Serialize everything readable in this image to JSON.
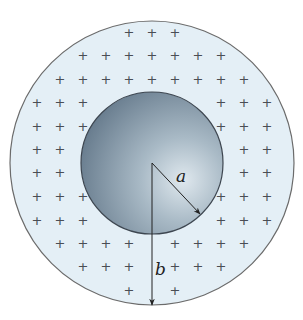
{
  "diagram": {
    "outer_circle": {
      "cx": 152,
      "cy": 163,
      "r": 142,
      "fill": "#e4eff6",
      "stroke": "#6b6b6b"
    },
    "inner_circle": {
      "cx": 152,
      "cy": 163,
      "r": 71,
      "fill_light": "#d9e3ea",
      "fill_dark": "#5f7587",
      "stroke": "#3d4650"
    },
    "charge_symbol": "+",
    "charges": [
      [
        129,
        32
      ],
      [
        152,
        32
      ],
      [
        175,
        32
      ],
      [
        83,
        55
      ],
      [
        106,
        55
      ],
      [
        129,
        55
      ],
      [
        152,
        55
      ],
      [
        175,
        55
      ],
      [
        198,
        55
      ],
      [
        221,
        55
      ],
      [
        60,
        79
      ],
      [
        83,
        79
      ],
      [
        106,
        79
      ],
      [
        129,
        79
      ],
      [
        152,
        79
      ],
      [
        175,
        79
      ],
      [
        198,
        79
      ],
      [
        221,
        79
      ],
      [
        244,
        79
      ],
      [
        37,
        102
      ],
      [
        60,
        102
      ],
      [
        83,
        102
      ],
      [
        221,
        102
      ],
      [
        244,
        102
      ],
      [
        267,
        102
      ],
      [
        37,
        126
      ],
      [
        60,
        126
      ],
      [
        83,
        126
      ],
      [
        221,
        126
      ],
      [
        244,
        126
      ],
      [
        267,
        126
      ],
      [
        37,
        149
      ],
      [
        60,
        149
      ],
      [
        244,
        149
      ],
      [
        267,
        149
      ],
      [
        37,
        172
      ],
      [
        60,
        172
      ],
      [
        244,
        172
      ],
      [
        267,
        172
      ],
      [
        37,
        196
      ],
      [
        60,
        196
      ],
      [
        83,
        196
      ],
      [
        221,
        196
      ],
      [
        244,
        196
      ],
      [
        267,
        196
      ],
      [
        37,
        220
      ],
      [
        60,
        220
      ],
      [
        83,
        220
      ],
      [
        221,
        220
      ],
      [
        244,
        220
      ],
      [
        267,
        220
      ],
      [
        60,
        243
      ],
      [
        83,
        243
      ],
      [
        106,
        243
      ],
      [
        129,
        243
      ],
      [
        175,
        243
      ],
      [
        198,
        243
      ],
      [
        221,
        243
      ],
      [
        244,
        243
      ],
      [
        83,
        266
      ],
      [
        106,
        266
      ],
      [
        129,
        266
      ],
      [
        175,
        266
      ],
      [
        198,
        266
      ],
      [
        221,
        266
      ],
      [
        129,
        290
      ],
      [
        175,
        290
      ]
    ],
    "radius_a": {
      "label": "a",
      "x1": 152,
      "y1": 163,
      "x2": 200,
      "y2": 214,
      "label_x": 176,
      "label_y": 182
    },
    "radius_b": {
      "label": "b",
      "x1": 152,
      "y1": 163,
      "x2": 152,
      "y2": 305,
      "label_x": 155,
      "label_y": 275
    }
  }
}
